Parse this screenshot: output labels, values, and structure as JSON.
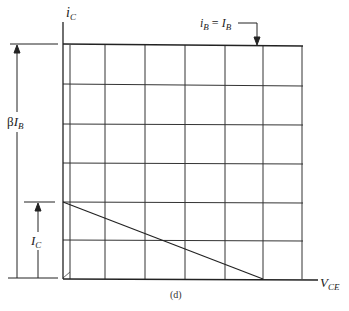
{
  "figure": {
    "caption": "(d)",
    "y_axis_label": {
      "main": "i",
      "sub": "C"
    },
    "x_axis_label": {
      "main": "V",
      "sub": "CE"
    },
    "curve_label": {
      "lhs_main": "i",
      "lhs_sub": "B",
      "eq": " = ",
      "rhs_main": "I",
      "rhs_sub": "B"
    },
    "dim_upper": {
      "prefix": "β",
      "main": "I",
      "sub": "B"
    },
    "dim_lower": {
      "main": "I",
      "sub": "C"
    }
  },
  "colors": {
    "line": "#2a2a2a",
    "background": "#ffffff"
  }
}
